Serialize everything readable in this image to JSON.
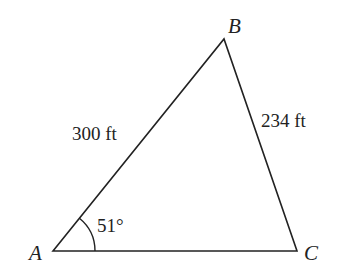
{
  "diagram": {
    "type": "triangle",
    "vertices": [
      {
        "label": "A",
        "x": 53,
        "y": 251
      },
      {
        "label": "B",
        "x": 224,
        "y": 39
      },
      {
        "label": "C",
        "x": 297,
        "y": 251
      }
    ],
    "sides": [
      {
        "from": "A",
        "to": "B",
        "label": "300 ft"
      },
      {
        "from": "B",
        "to": "C",
        "label": "234 ft"
      }
    ],
    "angles": [
      {
        "vertex": "A",
        "label": "51°"
      }
    ],
    "stroke_color": "#222222"
  }
}
